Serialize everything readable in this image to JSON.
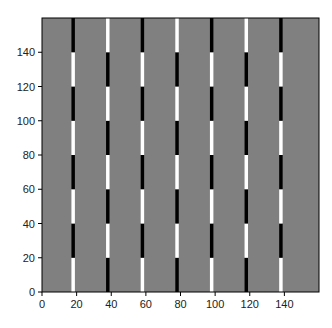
{
  "chart_data": {
    "type": "heatmap",
    "title": "",
    "xlabel": "",
    "ylabel": "",
    "xlim": [
      0,
      160
    ],
    "ylim": [
      0,
      160
    ],
    "grid": false,
    "background_color": "#808080",
    "x_ticks": [
      0,
      20,
      40,
      60,
      80,
      100,
      120,
      140
    ],
    "y_ticks": [
      0,
      20,
      40,
      60,
      80,
      100,
      120,
      140
    ],
    "stripe_width": 2,
    "segment_height": 20,
    "colors": {
      "B": "#000000",
      "W": "#ffffff"
    },
    "stripes": [
      {
        "x": 18,
        "segments_bottom_to_top": [
          "W",
          "B",
          "W",
          "B",
          "W",
          "B",
          "W",
          "B"
        ]
      },
      {
        "x": 38,
        "segments_bottom_to_top": [
          "B",
          "W",
          "B",
          "W",
          "B",
          "W",
          "B",
          "W"
        ]
      },
      {
        "x": 58,
        "segments_bottom_to_top": [
          "W",
          "B",
          "W",
          "B",
          "W",
          "B",
          "W",
          "B"
        ]
      },
      {
        "x": 78,
        "segments_bottom_to_top": [
          "B",
          "W",
          "B",
          "W",
          "B",
          "W",
          "B",
          "W"
        ]
      },
      {
        "x": 98,
        "segments_bottom_to_top": [
          "W",
          "B",
          "W",
          "B",
          "W",
          "B",
          "W",
          "B"
        ]
      },
      {
        "x": 118,
        "segments_bottom_to_top": [
          "B",
          "W",
          "B",
          "W",
          "B",
          "W",
          "B",
          "W"
        ]
      },
      {
        "x": 138,
        "segments_bottom_to_top": [
          "W",
          "B",
          "W",
          "B",
          "W",
          "B",
          "W",
          "B"
        ]
      }
    ]
  },
  "layout": {
    "plot_left": 42,
    "plot_top": 18,
    "plot_width": 277,
    "plot_height": 274
  }
}
